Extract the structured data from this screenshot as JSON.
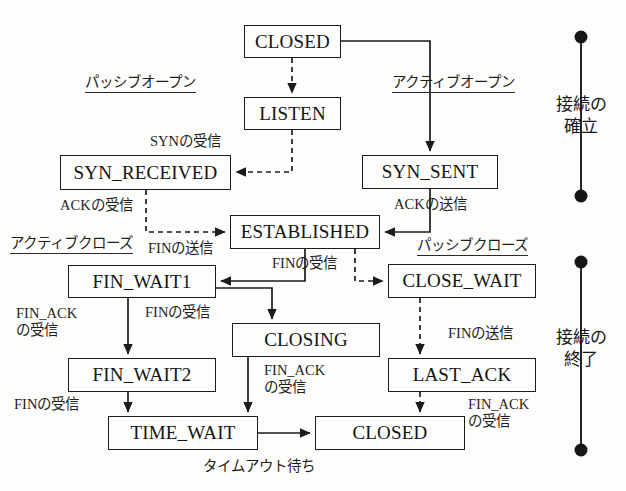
{
  "diagram": {
    "colors": {
      "ink": "#141414",
      "line": "#1b1b1b",
      "background": "#fdfdfc"
    },
    "states": [
      {
        "id": "closed-top",
        "label": "CLOSED",
        "x": 244,
        "y": 25,
        "w": 97,
        "h": 33
      },
      {
        "id": "listen",
        "label": "LISTEN",
        "x": 244,
        "y": 97,
        "w": 97,
        "h": 33
      },
      {
        "id": "syn-received",
        "label": "SYN_RECEIVED",
        "x": 60,
        "y": 155,
        "w": 171,
        "h": 35
      },
      {
        "id": "syn-sent",
        "label": "SYN_SENT",
        "x": 362,
        "y": 155,
        "w": 136,
        "h": 34
      },
      {
        "id": "established",
        "label": "ESTABLISHED",
        "x": 230,
        "y": 215,
        "w": 150,
        "h": 34
      },
      {
        "id": "fin-wait1",
        "label": "FIN_WAIT1",
        "x": 68,
        "y": 265,
        "w": 148,
        "h": 33
      },
      {
        "id": "close-wait",
        "label": "CLOSE_WAIT",
        "x": 388,
        "y": 264,
        "w": 148,
        "h": 34
      },
      {
        "id": "closing",
        "label": "CLOSING",
        "x": 232,
        "y": 323,
        "w": 148,
        "h": 34
      },
      {
        "id": "fin-wait2",
        "label": "FIN_WAIT2",
        "x": 68,
        "y": 358,
        "w": 148,
        "h": 34
      },
      {
        "id": "last-ack",
        "label": "LAST_ACK",
        "x": 388,
        "y": 358,
        "w": 148,
        "h": 34
      },
      {
        "id": "time-wait",
        "label": "TIME_WAIT",
        "x": 108,
        "y": 416,
        "w": 150,
        "h": 34
      },
      {
        "id": "closed-bottom",
        "label": "CLOSED",
        "x": 315,
        "y": 416,
        "w": 150,
        "h": 34
      }
    ],
    "phase_labels": [
      {
        "id": "passive-open",
        "label": "パッシブオープン",
        "x": 85,
        "y": 70
      },
      {
        "id": "active-open",
        "label": "アクティブオープン",
        "x": 392,
        "y": 70
      },
      {
        "id": "active-close",
        "label": "アクティブクローズ",
        "x": 10,
        "y": 231
      },
      {
        "id": "passive-close",
        "label": "パッシブクローズ",
        "x": 417,
        "y": 233
      }
    ],
    "edge_labels": [
      {
        "id": "syn-received-event",
        "label": "SYNの受信",
        "x": 150,
        "y": 133,
        "align": "left"
      },
      {
        "id": "ack-received-event",
        "label": "ACKの受信",
        "x": 60,
        "y": 197,
        "align": "left"
      },
      {
        "id": "ack-sent-event",
        "label": "ACKの送信",
        "x": 394,
        "y": 196,
        "align": "left"
      },
      {
        "id": "fin-sent-event",
        "label": "FINの送信",
        "x": 148,
        "y": 240,
        "align": "left"
      },
      {
        "id": "fin-received-mid",
        "label": "FINの受信",
        "x": 272,
        "y": 255,
        "align": "left"
      },
      {
        "id": "fin-ack-received-l",
        "label": "FIN_ACK\nの受信",
        "x": 16,
        "y": 305,
        "align": "left"
      },
      {
        "id": "fin-received-closing",
        "label": "FINの受信",
        "x": 145,
        "y": 304,
        "align": "left"
      },
      {
        "id": "fin-sent-close-wait",
        "label": "FINの送信",
        "x": 448,
        "y": 325,
        "align": "left"
      },
      {
        "id": "fin-ack-received-c",
        "label": "FIN_ACK\nの受信",
        "x": 264,
        "y": 362,
        "align": "left"
      },
      {
        "id": "fin-received-fw2",
        "label": "FINの受信",
        "x": 14,
        "y": 396,
        "align": "left"
      },
      {
        "id": "fin-ack-received-r",
        "label": "FIN_ACK\nの受信",
        "x": 468,
        "y": 396,
        "align": "left"
      },
      {
        "id": "timeout-wait",
        "label": "タイムアウト待ち",
        "x": 203,
        "y": 458,
        "align": "left"
      }
    ],
    "brackets": [
      {
        "id": "connection-establish",
        "label": "接続の\n確立",
        "x": 546,
        "y_top": 37,
        "y_bottom": 196,
        "text_y": 94
      },
      {
        "id": "connection-terminate",
        "label": "接続の\n終了",
        "x": 546,
        "y_top": 262,
        "y_bottom": 450,
        "text_y": 327
      }
    ],
    "transitions": [
      {
        "from": "closed-top",
        "to": "listen",
        "style": "dashed",
        "event": ""
      },
      {
        "from": "closed-top",
        "to": "syn-sent",
        "style": "solid",
        "event": ""
      },
      {
        "from": "listen",
        "to": "syn-received",
        "style": "dashed",
        "event": "SYNの受信"
      },
      {
        "from": "syn-received",
        "to": "established",
        "style": "dashed",
        "event": "ACKの受信"
      },
      {
        "from": "syn-sent",
        "to": "established",
        "style": "solid",
        "event": "ACKの送信"
      },
      {
        "from": "established",
        "to": "fin-wait1",
        "style": "solid",
        "event": "FINの送信"
      },
      {
        "from": "established",
        "to": "close-wait",
        "style": "dashed",
        "event": "FINの受信"
      },
      {
        "from": "fin-wait1",
        "to": "fin-wait2",
        "style": "solid",
        "event": "FIN_ACKの受信"
      },
      {
        "from": "fin-wait1",
        "to": "closing",
        "style": "solid",
        "event": "FINの受信"
      },
      {
        "from": "close-wait",
        "to": "last-ack",
        "style": "dashed",
        "event": "FINの送信"
      },
      {
        "from": "closing",
        "to": "time-wait",
        "style": "solid",
        "event": "FIN_ACKの受信"
      },
      {
        "from": "fin-wait2",
        "to": "time-wait",
        "style": "solid",
        "event": "FINの受信"
      },
      {
        "from": "last-ack",
        "to": "closed-bottom",
        "style": "dashed",
        "event": "FIN_ACKの受信"
      },
      {
        "from": "time-wait",
        "to": "closed-bottom",
        "style": "solid",
        "event": "タイムアウト待ち"
      }
    ]
  }
}
